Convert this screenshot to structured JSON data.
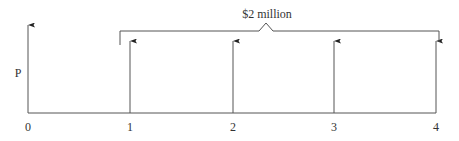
{
  "diagram": {
    "type": "cash-flow-timeline",
    "bracket_label": "$2 million",
    "present_value_label": "P",
    "periods": [
      {
        "label": "0",
        "x": 28,
        "arrow_top": 25
      },
      {
        "label": "1",
        "x": 130,
        "arrow_top": 41
      },
      {
        "label": "2",
        "x": 233,
        "arrow_top": 41
      },
      {
        "label": "3",
        "x": 334,
        "arrow_top": 41
      },
      {
        "label": "4",
        "x": 436,
        "arrow_top": 41
      }
    ],
    "colors": {
      "line": "#444444",
      "text": "#333333"
    }
  }
}
